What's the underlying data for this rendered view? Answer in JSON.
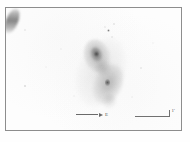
{
  "figure": {
    "type": "astronomical-image",
    "caption": "",
    "background_color": "#fdfdfd",
    "frame_color": "#8d8d8d",
    "ink_color": "#5c5c5c"
  },
  "annotations": {
    "orientation_arrow": {
      "label": "E",
      "direction": "right",
      "icon": "arrow-right-icon"
    },
    "scale_bar": {
      "label": "1'",
      "icon": "scale-bar-icon"
    }
  },
  "objects": {
    "galaxy_pair": {
      "name": "interacting-galaxy-pair",
      "north_component": "N",
      "south_component": "S"
    },
    "point_sources": [
      {
        "id": "star-1",
        "x": 24,
        "y": 29,
        "size": 1.6,
        "opacity": 0.3
      },
      {
        "id": "star-2",
        "x": 113,
        "y": 23,
        "size": 1.8,
        "opacity": 0.42
      },
      {
        "id": "star-3",
        "x": 104,
        "y": 26,
        "size": 1.4,
        "opacity": 0.26
      },
      {
        "id": "star-4",
        "x": 107,
        "y": 29,
        "size": 3.0,
        "opacity": 0.78
      },
      {
        "id": "star-5",
        "x": 111,
        "y": 36,
        "size": 1.8,
        "opacity": 0.34
      },
      {
        "id": "star-6",
        "x": 140,
        "y": 67,
        "size": 2.0,
        "opacity": 0.36
      },
      {
        "id": "star-7",
        "x": 24,
        "y": 85,
        "size": 2.8,
        "opacity": 0.62
      },
      {
        "id": "star-8",
        "x": 60,
        "y": 48,
        "size": 1.2,
        "opacity": 0.14
      },
      {
        "id": "star-9",
        "x": 152,
        "y": 42,
        "size": 1.2,
        "opacity": 0.12
      },
      {
        "id": "star-10",
        "x": 73,
        "y": 95,
        "size": 1.2,
        "opacity": 0.13
      },
      {
        "id": "star-11",
        "x": 131,
        "y": 96,
        "size": 1.3,
        "opacity": 0.15
      },
      {
        "id": "star-12",
        "x": 45,
        "y": 66,
        "size": 1.1,
        "opacity": 0.11
      }
    ]
  }
}
